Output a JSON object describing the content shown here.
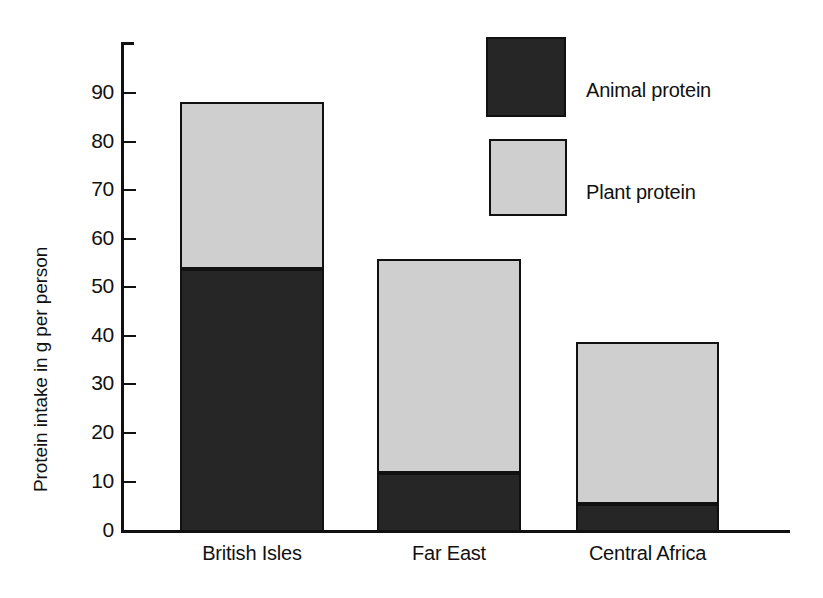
{
  "chart_data": {
    "type": "bar",
    "subtype": "stacked-bar",
    "title": "",
    "xlabel": "",
    "ylabel": "Protein intake in g per person",
    "categories": [
      "British Isles",
      "Far East",
      "Central Africa"
    ],
    "series": [
      {
        "name": "Animal protein",
        "color": "#262626",
        "values": [
          54,
          12,
          5.5
        ]
      },
      {
        "name": "Plant protein",
        "color": "#cfcfcf",
        "values": [
          34.5,
          44,
          33.5
        ]
      }
    ],
    "totals": [
      88.5,
      56,
      39
    ],
    "ylim": [
      0,
      100
    ],
    "ytick_values": [
      0,
      10,
      20,
      30,
      40,
      50,
      60,
      70,
      80,
      90
    ],
    "ytick_labels": [
      "0",
      "10",
      "20",
      "30",
      "40",
      "50",
      "60",
      "70",
      "80",
      "90"
    ],
    "grid": false,
    "legend_position": "top-right",
    "legend_entries": [
      {
        "label": "Animal protein",
        "swatch": "#262626"
      },
      {
        "label": "Plant protein",
        "swatch": "#cfcfcf"
      }
    ]
  },
  "axis": {
    "y_title": "Protein intake in g per person",
    "ticks": [
      {
        "label": "90"
      },
      {
        "label": "80"
      },
      {
        "label": "70"
      },
      {
        "label": "60"
      },
      {
        "label": "50"
      },
      {
        "label": "40"
      },
      {
        "label": "30"
      },
      {
        "label": "20"
      },
      {
        "label": "10"
      },
      {
        "label": "0"
      }
    ]
  },
  "categories": [
    {
      "label": "British Isles"
    },
    {
      "label": "Far East"
    },
    {
      "label": "Central Africa"
    }
  ],
  "legend": {
    "animal": {
      "label": "Animal protein"
    },
    "plant": {
      "label": "Plant protein"
    }
  }
}
